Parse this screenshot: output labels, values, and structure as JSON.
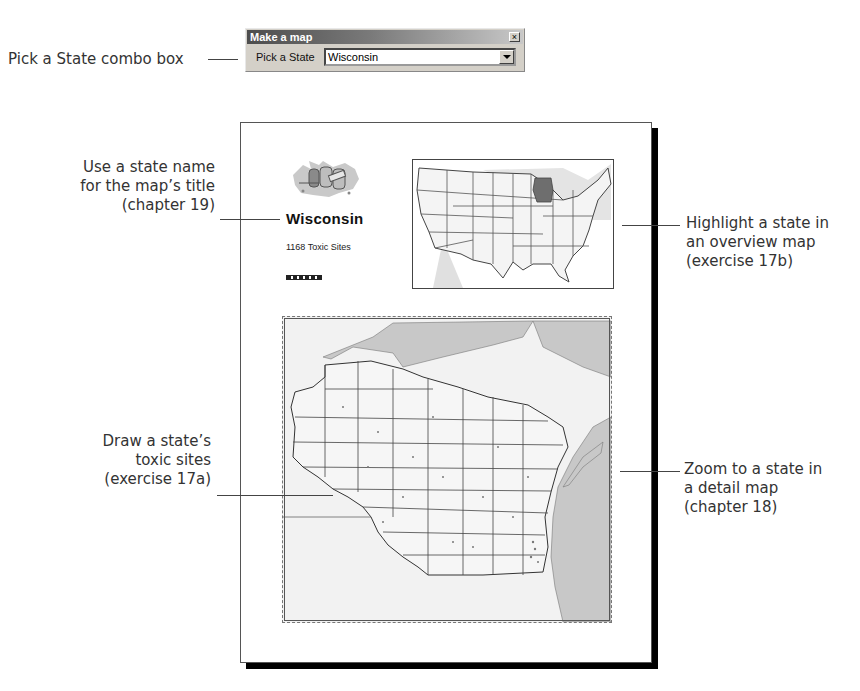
{
  "dialog": {
    "title": "Make a map",
    "close_label": "×",
    "field_label": "Pick a State",
    "combo_value": "Wisconsin"
  },
  "callouts": {
    "combo": "Pick a State combo box",
    "title_line1": "Use a state name",
    "title_line2": "for the map’s title",
    "title_line3": "(chapter 19)",
    "overview_line1": "Highlight a state in",
    "overview_line2": "an overview map",
    "overview_line3": "(exercise 17b)",
    "toxic_line1": "Draw a state’s",
    "toxic_line2": "toxic sites",
    "toxic_line3": "(exercise 17a)",
    "detail_line1": "Zoom to a state in",
    "detail_line2": "a detail map",
    "detail_line3": "(chapter 18)"
  },
  "layout": {
    "state_title": "Wisconsin",
    "subtitle": "1168 Toxic Sites",
    "highlight_color": "#6e6e6e",
    "water_color": "#c8c8c8",
    "land_color": "#f2f2f2"
  }
}
